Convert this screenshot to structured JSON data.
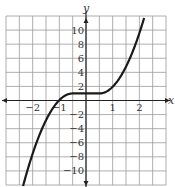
{
  "chart_data": {
    "type": "line",
    "title": "",
    "xlabel": "x",
    "ylabel": "y",
    "xlim": [
      -3,
      3
    ],
    "ylim": [
      -12,
      12
    ],
    "grid": true,
    "x_grid_step": 0.5,
    "y_grid_step": 2,
    "x_ticks": [
      -2,
      -1,
      1,
      2
    ],
    "x_tick_labels": [
      "−2",
      "−1",
      "1",
      "2"
    ],
    "y_ticks": [
      10,
      8,
      6,
      4,
      2,
      -2,
      -4,
      -6,
      -8,
      -10
    ],
    "y_tick_labels": [
      "10",
      "8",
      "6",
      "4",
      "2",
      "−2",
      "−4",
      "−6",
      "−8",
      "−10"
    ],
    "series": [
      {
        "name": "f(x)",
        "description": "Increasing curve, flat at y=1 for -0.5<=x<=0.5, crosses x-axis near x=-1",
        "x": [
          -2.36,
          -2,
          -1.5,
          -1,
          -0.5,
          0,
          0.5,
          1,
          1.5,
          2,
          2.2
        ],
        "values": [
          -12.1,
          -7.6,
          -2.8,
          0.05,
          1,
          1,
          1,
          1.95,
          4.8,
          9.6,
          12
        ]
      }
    ],
    "colors": {
      "curve": "#1a1a1a",
      "grid": "#9a9a9a",
      "axis": "#222222"
    }
  }
}
